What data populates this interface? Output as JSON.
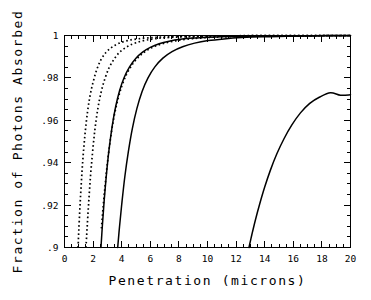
{
  "chart_data": {
    "type": "line",
    "title": "",
    "xlabel": "Penetration (microns)",
    "ylabel": "Fraction of Photons Absorbed",
    "xlim": [
      0,
      20
    ],
    "ylim": [
      0.9,
      1.0
    ],
    "grid": false,
    "legend": "none",
    "xticks": [
      0,
      2,
      4,
      6,
      8,
      10,
      12,
      14,
      16,
      18,
      20
    ],
    "xticklabels": [
      "0",
      "2",
      "4",
      "6",
      "8",
      "10",
      "12",
      "14",
      "16",
      "18",
      "20"
    ],
    "yticks": [
      0.9,
      0.92,
      0.94,
      0.96,
      0.98,
      1.0
    ],
    "yticklabels": [
      ".9",
      ".92",
      ".94",
      ".96",
      ".98",
      "1"
    ],
    "x_minor_per_major": 4,
    "y_minor_per_major": 4,
    "series": [
      {
        "name": "curve-1",
        "style": "dotted",
        "x": [
          0.95,
          1.0,
          1.08,
          1.18,
          1.3,
          1.45,
          1.62,
          1.8,
          2.0,
          2.25,
          2.55,
          2.9,
          3.3,
          3.8,
          4.4,
          5.1,
          5.9,
          6.8,
          7.8,
          9.0,
          10.5,
          12.5,
          15.0,
          17.5,
          20.0
        ],
        "y": [
          0.9,
          0.908,
          0.919,
          0.931,
          0.943,
          0.9545,
          0.9645,
          0.972,
          0.978,
          0.9838,
          0.9886,
          0.992,
          0.9944,
          0.9963,
          0.9976,
          0.9984,
          0.9989,
          0.9993,
          0.9995,
          0.9997,
          0.9998,
          0.9999,
          0.9999,
          1.0,
          1.0
        ]
      },
      {
        "name": "curve-2",
        "style": "dotted",
        "x": [
          1.5,
          1.58,
          1.68,
          1.8,
          1.95,
          2.12,
          2.32,
          2.55,
          2.82,
          3.12,
          3.48,
          3.9,
          4.4,
          5.0,
          5.7,
          6.5,
          7.4,
          8.5,
          9.8,
          11.3,
          13.2,
          15.5,
          18.0,
          20.0
        ],
        "y": [
          0.9,
          0.909,
          0.92,
          0.932,
          0.944,
          0.9552,
          0.965,
          0.973,
          0.9795,
          0.9848,
          0.989,
          0.9924,
          0.9948,
          0.9966,
          0.9978,
          0.9986,
          0.9991,
          0.9994,
          0.9996,
          0.9998,
          0.9999,
          0.9999,
          1.0,
          1.0
        ]
      },
      {
        "name": "curve-3",
        "style": "solid",
        "x": [
          2.55,
          2.65,
          2.78,
          2.94,
          3.12,
          3.34,
          3.58,
          3.86,
          4.18,
          4.55,
          4.98,
          5.46,
          6.0,
          6.62,
          7.32,
          8.1,
          9.0,
          10.1,
          11.4,
          13.0,
          15.0,
          17.3,
          20.0
        ],
        "y": [
          0.9,
          0.9105,
          0.9225,
          0.935,
          0.9465,
          0.9575,
          0.9665,
          0.9742,
          0.9803,
          0.9852,
          0.9892,
          0.9922,
          0.9944,
          0.9961,
          0.9973,
          0.9982,
          0.9988,
          0.9992,
          0.9995,
          0.9997,
          0.9998,
          0.9999,
          1.0
        ]
      },
      {
        "name": "curve-4",
        "style": "dotted",
        "x": [
          2.58,
          2.7,
          2.85,
          3.02,
          3.22,
          3.45,
          3.72,
          4.02,
          4.36,
          4.76,
          5.22,
          5.74,
          6.32,
          7.0,
          7.76,
          8.62,
          9.6,
          10.8,
          12.2,
          13.9,
          16.0,
          18.2,
          20.0
        ],
        "y": [
          0.909,
          0.919,
          0.93,
          0.941,
          0.9515,
          0.9612,
          0.9695,
          0.9764,
          0.982,
          0.9865,
          0.9901,
          0.9929,
          0.9949,
          0.9964,
          0.9975,
          0.9983,
          0.9989,
          0.9993,
          0.9995,
          0.9997,
          0.9998,
          0.9999,
          1.0
        ]
      },
      {
        "name": "curve-5",
        "style": "solid",
        "x": [
          3.72,
          3.85,
          4.02,
          4.22,
          4.46,
          4.74,
          5.06,
          5.42,
          5.84,
          6.32,
          6.88,
          7.52,
          8.26,
          9.1,
          10.05,
          11.15,
          12.4,
          13.85,
          15.5,
          17.4,
          19.4,
          20.0
        ],
        "y": [
          0.9,
          0.91,
          0.9215,
          0.9335,
          0.945,
          0.956,
          0.9655,
          0.9735,
          0.98,
          0.9852,
          0.9893,
          0.9924,
          0.9947,
          0.9964,
          0.9976,
          0.9984,
          0.999,
          0.9994,
          0.9996,
          0.9998,
          0.9999,
          0.9999
        ]
      },
      {
        "name": "curve-6",
        "style": "solid",
        "x": [
          12.9,
          13.1,
          13.35,
          13.65,
          14.0,
          14.4,
          14.85,
          15.35,
          15.9,
          16.5,
          17.15,
          17.85,
          18.6,
          19.3,
          20.0
        ],
        "y": [
          0.9,
          0.906,
          0.913,
          0.9205,
          0.9285,
          0.9365,
          0.9442,
          0.9513,
          0.9578,
          0.9635,
          0.968,
          0.971,
          0.973,
          0.9718,
          0.972
        ]
      }
    ]
  }
}
